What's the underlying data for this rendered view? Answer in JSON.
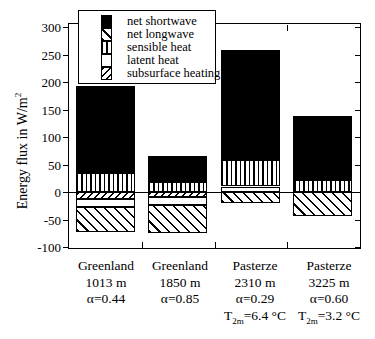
{
  "y_axis": {
    "title_pre": "Energy flux in W/m",
    "title_sup": "2",
    "ticks": [
      "300",
      "250",
      "200",
      "150",
      "100",
      "50",
      "0",
      "-50",
      "-100"
    ]
  },
  "legend": {
    "items": [
      {
        "label": "net shortwave",
        "pattern": "solid"
      },
      {
        "label": "net longwave",
        "pattern": "diag-down"
      },
      {
        "label": "sensible heat",
        "pattern": "vert"
      },
      {
        "label": "latent heat",
        "pattern": "plain"
      },
      {
        "label": "subsurface heating",
        "pattern": "diag-up"
      }
    ]
  },
  "chart_data": {
    "type": "bar",
    "stacked": true,
    "title": "",
    "xlabel": "",
    "ylabel": "Energy flux in W/m²",
    "ylim": [
      -100,
      300
    ],
    "ytick_step": 50,
    "legend_position": "top-left-inside",
    "grid": false,
    "categories": [
      "Greenland 1013 m",
      "Greenland 1850 m",
      "Pasterze 2310 m",
      "Pasterze 3225 m"
    ],
    "series": [
      {
        "name": "net shortwave",
        "pattern": "solid",
        "values": [
          158,
          48,
          201,
          117
        ]
      },
      {
        "name": "net longwave",
        "pattern": "diag-down",
        "values": [
          -46,
          -51,
          -20,
          -44
        ]
      },
      {
        "name": "sensible heat",
        "pattern": "vert",
        "values": [
          35,
          18,
          48,
          21
        ]
      },
      {
        "name": "latent heat",
        "pattern": "plain",
        "values": [
          -14,
          -14,
          10,
          0
        ]
      },
      {
        "name": "subsurface heating",
        "pattern": "diag-up",
        "values": [
          -13,
          -9,
          0,
          0
        ]
      }
    ],
    "stack_order_from_zero": [
      "subsurface heating",
      "latent heat",
      "sensible heat",
      "net longwave",
      "net shortwave"
    ],
    "x_labels": [
      {
        "site": "Greenland",
        "elevation": "1013 m",
        "albedo": "α=0.44",
        "t2m": null
      },
      {
        "site": "Greenland",
        "elevation": "1850 m",
        "albedo": "α=0.85",
        "t2m": null
      },
      {
        "site": "Pasterze",
        "elevation": "2310 m",
        "albedo": "α=0.29",
        "t2m": {
          "pre": "T",
          "sub": "2m",
          "rest": "=6.4 °C"
        }
      },
      {
        "site": "Pasterze",
        "elevation": "3225 m",
        "albedo": "α=0.60",
        "t2m": {
          "pre": "T",
          "sub": "2m",
          "rest": "=3.2 °C"
        }
      }
    ]
  }
}
